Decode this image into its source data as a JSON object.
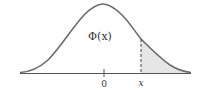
{
  "figure": {
    "curve_label": "Φ(x)",
    "axis_ticks": [
      {
        "label": "0",
        "x": 0
      },
      {
        "label": "x",
        "x": "x"
      }
    ],
    "shaded_region": "right tail beyond x",
    "colors": {
      "curve": "#6b6b6b",
      "axis": "#555555",
      "shade": "#e6e6e6",
      "text": "#333333"
    }
  }
}
